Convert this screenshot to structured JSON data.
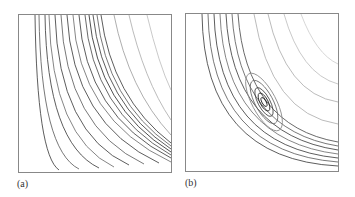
{
  "figure": {
    "panels": [
      {
        "id": "a",
        "label": "(a)",
        "description": "Family of hyperbola-like trajectories, dense near lower-left corner"
      },
      {
        "id": "b",
        "label": "(b)",
        "description": "Trajectories with nested closed orbits around a center point plus outer hyperbola-like curves"
      }
    ]
  },
  "colors": {
    "line_dark": "#333333",
    "line_light": "#999999",
    "frame": "#888888"
  }
}
